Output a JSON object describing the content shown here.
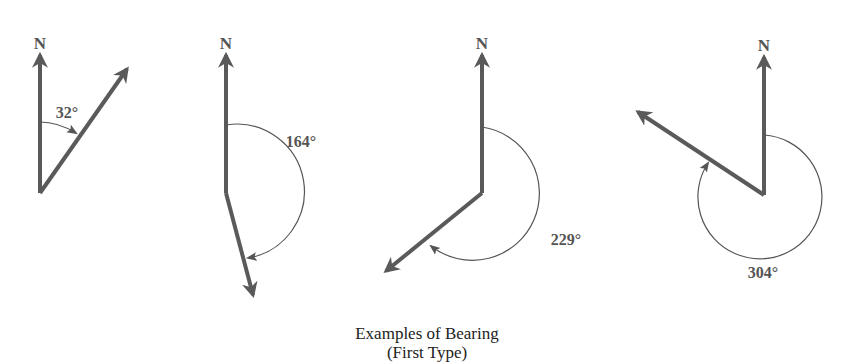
{
  "diagram": {
    "title": "Examples of Bearing",
    "subtitle": "(First Type)",
    "colors": {
      "vector": "#5a5a5a",
      "arc": "#555555",
      "text": "#555555"
    },
    "north_label": "N",
    "examples": [
      {
        "bearing_label": "32°",
        "bearing_deg": 32
      },
      {
        "bearing_label": "164°",
        "bearing_deg": 164
      },
      {
        "bearing_label": "229°",
        "bearing_deg": 229
      },
      {
        "bearing_label": "304°",
        "bearing_deg": 304
      }
    ]
  }
}
